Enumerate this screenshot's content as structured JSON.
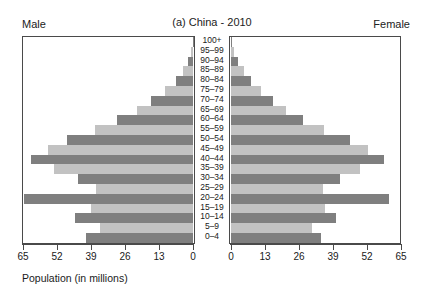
{
  "labels": {
    "male": "Male",
    "female": "Female",
    "title": "(a)  China - 2010",
    "x_axis_title": "Population (in millions)"
  },
  "colors": {
    "bar_dark": "#7f7f7f",
    "bar_light": "#c2c2c2",
    "frame": "#4a4a4a",
    "background": "#ffffff",
    "text": "#1a1a1a"
  },
  "chart_data": {
    "type": "bar",
    "subtype": "population-pyramid",
    "title": "(a)  China - 2010",
    "xlabel": "Population (in millions)",
    "ylabel": "",
    "grid": false,
    "legend": "none",
    "xlim_left": [
      65,
      0
    ],
    "xlim_right": [
      0,
      65
    ],
    "xticks_left": [
      65,
      52,
      39,
      26,
      13,
      0
    ],
    "xticks_right": [
      0,
      13,
      26,
      39,
      52,
      65
    ],
    "categories": [
      "100+",
      "95–99",
      "90–94",
      "85–89",
      "80–84",
      "75–79",
      "70–74",
      "65–69",
      "60–64",
      "55–59",
      "50–54",
      "45–49",
      "40–44",
      "35–39",
      "30–34",
      "25–29",
      "20–24",
      "15–19",
      "10–14",
      "5–9",
      "0–4"
    ],
    "series": [
      {
        "name": "Male",
        "side": "left",
        "values": [
          0.1,
          0.6,
          1.8,
          3.9,
          6.6,
          10.6,
          16.0,
          21.5,
          29.0,
          37.5,
          48.0,
          55.5,
          62.0,
          53.0,
          44.0,
          37.0,
          64.5,
          39.0,
          45.0,
          35.5,
          41.0
        ]
      },
      {
        "name": "Female",
        "side": "right",
        "values": [
          0.2,
          1.0,
          2.6,
          5.1,
          7.8,
          11.6,
          16.2,
          21.0,
          27.5,
          35.5,
          45.5,
          52.5,
          58.5,
          49.5,
          41.5,
          35.0,
          60.5,
          36.0,
          40.0,
          31.0,
          34.5
        ]
      }
    ],
    "bar_color_pattern": [
      "dark",
      "light"
    ]
  }
}
